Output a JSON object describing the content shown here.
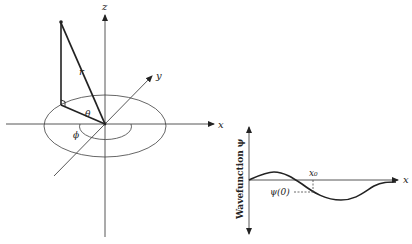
{
  "figure": {
    "left_panel": {
      "description": "Spherical coordinates",
      "axis_labels": {
        "x": "x",
        "y": "y",
        "z": "z"
      },
      "radius_label": "r",
      "polar_angle_label": "θ",
      "azimuth_label": "ϕ"
    },
    "right_panel": {
      "description": "Wavefunction plot",
      "y_axis_label": "Wavefunction ψ",
      "x_axis_label": "x",
      "x0_label": "x₀",
      "psi0_label": "ψ(0)"
    }
  },
  "colors": {
    "line": "#222222",
    "thin_line": "#555555",
    "background": "#ffffff"
  }
}
